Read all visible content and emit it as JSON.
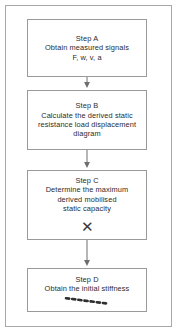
{
  "figure": {
    "border_color": "#a8a8a8",
    "box_border_color": "#9a9a9a",
    "text_color": "#2b2b2b",
    "background": "#ffffff"
  },
  "nodes": [
    {
      "id": "step-a",
      "label": "Step A",
      "text": "Step A\nObtain measured signals\nF, w, v, a",
      "annotation": "none"
    },
    {
      "id": "step-b",
      "label": "Step B",
      "text": "Step B\nCalculate the derived static\nresistance load displacement\ndiagram",
      "annotation": "none"
    },
    {
      "id": "step-c",
      "label": "Step C",
      "text": "Step C\nDetermine the maximum\nderived mobilised\nstatic capacity",
      "annotation": "x-mark",
      "annotation_glyph": "✕"
    },
    {
      "id": "step-d",
      "label": "Step D",
      "text": "Step D\nObtain the initial stiffness",
      "annotation": "dashed-stroke"
    }
  ],
  "connectors": [
    {
      "from": "step-a",
      "to": "step-b",
      "style": "solid-arrow"
    },
    {
      "from": "step-b",
      "to": "step-c",
      "style": "solid-arrow"
    },
    {
      "from": "step-c",
      "to": "step-d",
      "style": "solid-arrow"
    }
  ]
}
